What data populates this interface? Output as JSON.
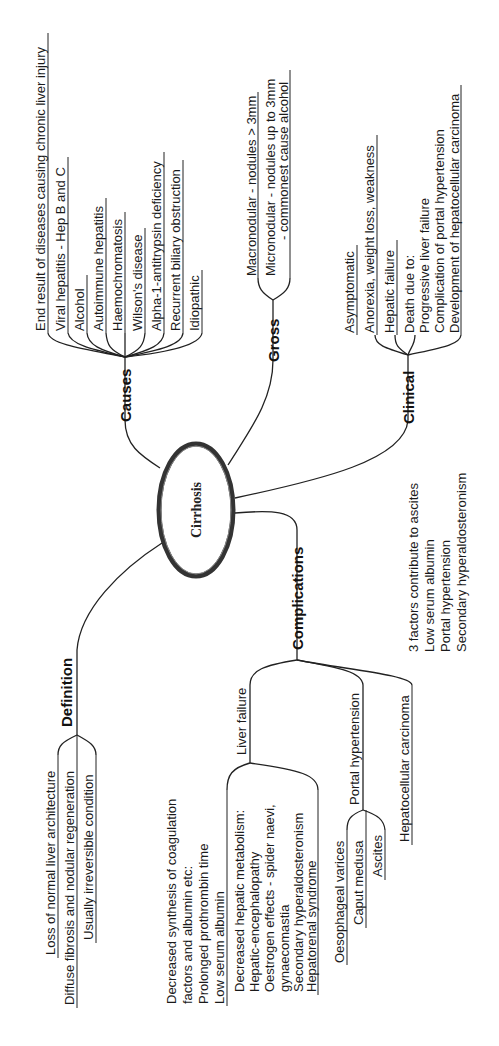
{
  "center": {
    "label": "Cirrhosis"
  },
  "causes": {
    "label": "Causes",
    "items": [
      "End result of diseases causing chronic liver injury",
      "Viral hepatitis - Hep B and C",
      "Alcohol",
      "Autoimmune hepatitis",
      "Haemochromatosis",
      "Wilson's disease",
      "Alpha-1-antitrypsin deficiency",
      "Recurrent biliary obstruction",
      "Idiopathic"
    ]
  },
  "gross": {
    "label": "Gross",
    "items": [
      "Macronodular - nodules > 3mm",
      "Micronodular - nodules up to 3mm",
      "- commonest cause alcohol"
    ]
  },
  "clinical": {
    "label": "Clinical",
    "items": [
      "Asymptomatic",
      "Anorexia, weight loss, weakness",
      "Hepatic failure",
      "Death due to:",
      "Progressive liver failure",
      "Complication of portal hypertension",
      "Development of hepatocellular carcinoma"
    ]
  },
  "definition": {
    "label": "Definition",
    "items": [
      "Loss of normal liver architecture",
      "Diffuse fibrosis and nodular regeneration",
      "Usually irreversible condition"
    ]
  },
  "complications": {
    "label": "Complications",
    "liver_failure": {
      "label": "Liver failure",
      "synthesis": [
        "Decreased synthesis of coagulation",
        "factors and albumin etc:",
        "Prolonged prothrombin time",
        "Low serum albumin"
      ],
      "metabolism": [
        "Decreased hepatic metabolism:",
        "Hepatic-encephalopathy",
        "Oestrogen effects - spider naevi,",
        "gynaecomastia",
        "Secondary hyperaldosteronism",
        "Hepatorenal syndrome"
      ]
    },
    "portal_hypertension": {
      "label": "Portal hypertension",
      "items": [
        "Oesophageal varices",
        "Caput medusa",
        "Ascites"
      ]
    },
    "hcc": {
      "label": "Hepatocellular carcinoma"
    }
  },
  "ascites_note": {
    "items": [
      "3 factors contribute to ascites",
      "Low serum albumin",
      "Portal hypertension",
      "Secondary hyperaldosteronism"
    ]
  }
}
